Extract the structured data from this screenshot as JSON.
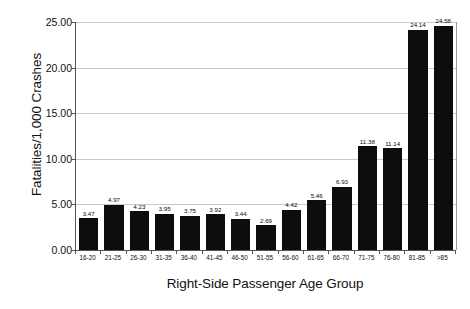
{
  "chart_data": {
    "type": "bar",
    "title": "",
    "xlabel": "Right-Side Passenger Age Group",
    "ylabel": "Fatalities/1,000 Crashes",
    "ylim": [
      0,
      25
    ],
    "ytick_step": 5,
    "ytick_labels": [
      "0.00",
      "5.00",
      "10.00",
      "15.00",
      "20.00",
      "25.00"
    ],
    "ytick_values": [
      0,
      5,
      10,
      15,
      20,
      25
    ],
    "grid": true,
    "legend": null,
    "bar_color": "#0d0d0d",
    "categories": [
      "16-20",
      "21-25",
      "26-30",
      "31-35",
      "36-40",
      "41-45",
      "46-50",
      "51-55",
      "56-60",
      "61-65",
      "66-70",
      "71-75",
      "76-80",
      "81-85",
      ">85"
    ],
    "values": [
      3.47,
      4.97,
      4.23,
      3.95,
      3.75,
      3.92,
      3.44,
      2.69,
      4.42,
      5.46,
      6.93,
      11.38,
      11.14,
      24.14,
      24.58
    ],
    "value_labels": [
      "3.47",
      "4.97",
      "4.23",
      "3.95",
      "3.75",
      "3.92",
      "3.44",
      "2.69",
      "4.42",
      "5.46",
      "6.93",
      "11.38",
      "11.14",
      "24.14",
      "24.58"
    ],
    "series": [
      {
        "name": "Fatalities per 1,000 Crashes",
        "values": [
          3.47,
          4.97,
          4.23,
          3.95,
          3.75,
          3.92,
          3.44,
          2.69,
          4.42,
          5.46,
          6.93,
          11.38,
          11.14,
          24.14,
          24.58
        ]
      }
    ]
  }
}
